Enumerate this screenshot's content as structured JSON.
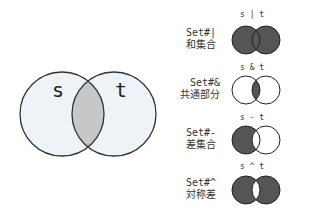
{
  "main_venn": {
    "left_label": "s",
    "right_label": "t",
    "colors": {
      "fill": "#eef3f7",
      "intersection": "#c5c7c9",
      "stroke": "#333333"
    }
  },
  "operations": [
    {
      "op": "s | t",
      "name": "Set#|",
      "jp": "和集合",
      "shade": "union"
    },
    {
      "op": "s & t",
      "name": "Set#&",
      "jp": "共通部分",
      "shade": "intersection"
    },
    {
      "op": "s - t",
      "name": "Set#-",
      "jp": "差集合",
      "shade": "difference"
    },
    {
      "op": "s ^ t",
      "name": "Set#^",
      "jp": "対称差",
      "shade": "symmetric-difference"
    }
  ],
  "colors": {
    "dark": "#555555",
    "light": "#ffffff",
    "stroke": "#222222"
  }
}
